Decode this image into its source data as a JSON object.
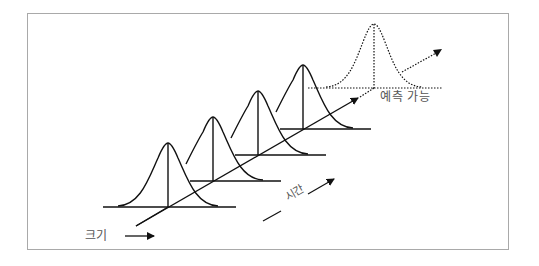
{
  "diagram": {
    "type": "distribution-over-time",
    "labels": {
      "size_axis": "크기",
      "time_axis": "시간",
      "predictable": "예측 가능"
    },
    "curves": [
      {
        "name": "distribution-1",
        "style": "solid"
      },
      {
        "name": "distribution-2",
        "style": "solid"
      },
      {
        "name": "distribution-3",
        "style": "solid"
      },
      {
        "name": "distribution-4",
        "style": "solid"
      },
      {
        "name": "predicted-distribution",
        "style": "dotted"
      }
    ],
    "colors": {
      "line": "#111111",
      "frame": "#a9a9a9",
      "label": "#555555"
    }
  }
}
